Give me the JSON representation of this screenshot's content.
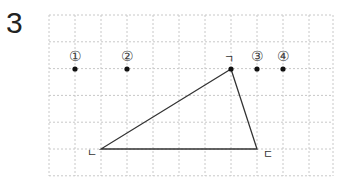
{
  "question_number": "3",
  "grid": {
    "left": 49,
    "top": 15,
    "cell_w": 26,
    "cell_h": 26.8,
    "cols": 11,
    "rows": 6,
    "right": 333,
    "bottom": 176,
    "line_color": "#c8c8c8"
  },
  "triangle": {
    "vertices": [
      {
        "label": "ㄱ",
        "x": 231,
        "y": 69
      },
      {
        "label": "ㄴ",
        "x": 101,
        "y": 149
      },
      {
        "label": "ㄷ",
        "x": 257,
        "y": 149
      }
    ],
    "stroke": "#333333"
  },
  "points": [
    {
      "label": "①",
      "x": 75,
      "y": 69
    },
    {
      "label": "②",
      "x": 127,
      "y": 69
    },
    {
      "label": "③",
      "x": 257,
      "y": 69
    },
    {
      "label": "④",
      "x": 283,
      "y": 69
    }
  ],
  "vertex_dot": {
    "x": 231,
    "y": 69
  }
}
